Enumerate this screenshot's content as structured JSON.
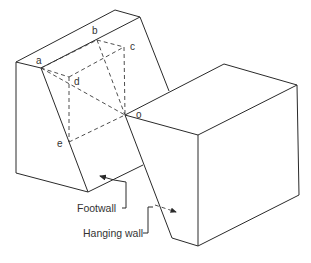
{
  "diagram": {
    "point_labels": {
      "a": "a",
      "b": "b",
      "c": "c",
      "d": "d",
      "e": "e",
      "o": "o"
    },
    "callouts": {
      "footwall": "Footwall",
      "hanging_wall": "Hanging wall"
    },
    "colors": {
      "line": "#2a2a2a",
      "text": "#333333",
      "background": "#ffffff"
    }
  }
}
